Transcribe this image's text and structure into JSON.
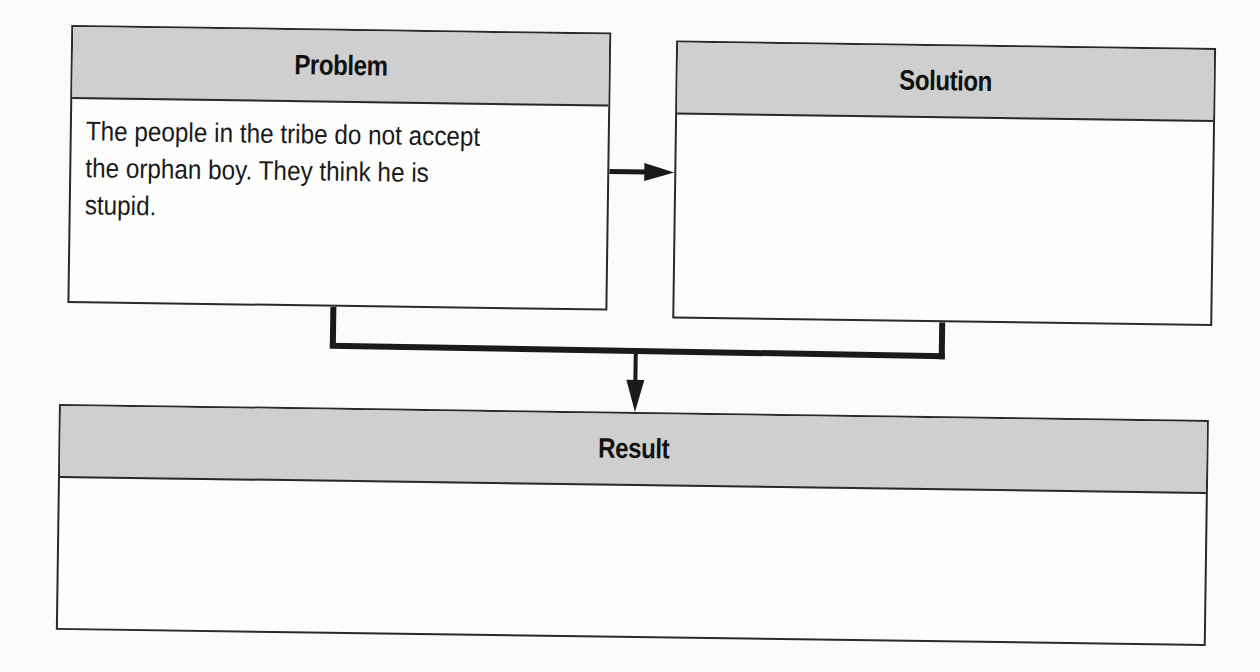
{
  "diagram": {
    "type": "problem-solution-result graphic organizer",
    "boxes": [
      {
        "id": "problem",
        "title": "Problem",
        "content": "The people in the tribe do not accept\nthe orphan boy. They think he is\nstupid."
      },
      {
        "id": "solution",
        "title": "Solution",
        "content": ""
      },
      {
        "id": "result",
        "title": "Result",
        "content": ""
      }
    ],
    "connections": [
      {
        "from": "problem",
        "to": "solution",
        "style": "arrow"
      },
      {
        "from": [
          "problem",
          "solution"
        ],
        "to": "result",
        "style": "bracket-arrow"
      }
    ],
    "colors": {
      "header_fill": "#cfcfcf",
      "border": "#2a2a2a",
      "background": "#fdfdfc"
    }
  }
}
